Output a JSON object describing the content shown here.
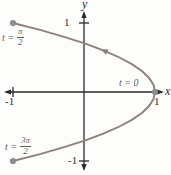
{
  "figure": {
    "background": "#fdfdfc",
    "axis_color": "#2a2a2a",
    "curve_color": "#8e817b",
    "dot_color": "#8c8c8c",
    "tick_label_color": "#303030",
    "t_label_color": "#5d5d5d"
  },
  "chart_data": {
    "type": "line",
    "title": "",
    "xlabel": "x",
    "ylabel": "y",
    "x_ticks": [
      -1,
      1
    ],
    "y_ticks": [
      1,
      -1
    ],
    "xlim": [
      -1.15,
      1.25
    ],
    "ylim": [
      -1.25,
      1.2
    ],
    "grid": false,
    "curve_points": [
      [
        -1,
        1
      ],
      [
        -0.62,
        0.9
      ],
      [
        -0.28,
        0.8
      ],
      [
        0.02,
        0.7
      ],
      [
        0.28,
        0.6
      ],
      [
        0.5,
        0.5
      ],
      [
        0.68,
        0.4
      ],
      [
        0.82,
        0.3
      ],
      [
        0.92,
        0.2
      ],
      [
        0.98,
        0.1
      ],
      [
        1,
        0
      ],
      [
        0.98,
        -0.1
      ],
      [
        0.92,
        -0.2
      ],
      [
        0.82,
        -0.3
      ],
      [
        0.68,
        -0.4
      ],
      [
        0.5,
        -0.5
      ],
      [
        0.28,
        -0.6
      ],
      [
        0.02,
        -0.7
      ],
      [
        -0.28,
        -0.8
      ],
      [
        -0.62,
        -0.9
      ],
      [
        -1,
        -1
      ]
    ],
    "marked_points": [
      {
        "label": "t = π/2",
        "x": -1,
        "y": 1
      },
      {
        "label": "t = 0",
        "x": 1,
        "y": 0
      },
      {
        "label": "t = 3π/2",
        "x": -1,
        "y": -1
      }
    ],
    "direction_arrow": {
      "from": [
        0.5,
        0.5
      ],
      "to": [
        0.28,
        0.6
      ]
    }
  },
  "labels": {
    "y_axis": "y",
    "x_axis": "x",
    "y_tick_top": "1",
    "y_tick_bottom": "-1",
    "x_tick_left": "-1",
    "x_tick_right": "1",
    "t_zero": "t = 0",
    "t_half": {
      "prefix": "t =",
      "num": "π",
      "den": "2"
    },
    "t_three_half": {
      "prefix": "t =",
      "num": "3π",
      "den": "2"
    }
  }
}
